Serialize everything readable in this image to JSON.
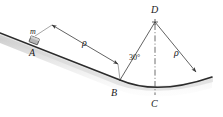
{
  "figure": {
    "colors": {
      "line": "#3a3a3a",
      "surface": "#2b2b2b",
      "shadow": "#c9c9c9",
      "block_fill": "#b5b5b5",
      "block_stroke": "#4a4a4a",
      "label": "#1a1a1a",
      "background": "#ffffff"
    },
    "labels": {
      "point_a": "A",
      "point_b": "B",
      "point_c": "C",
      "point_d": "D",
      "mass": "m",
      "radius_left": "ρ",
      "radius_right": "ρ",
      "angle": "30°"
    },
    "geometry": {
      "incline_start": [
        0,
        33
      ],
      "incline_end_at_b": [
        120,
        80
      ],
      "block_center": [
        34,
        41
      ],
      "center_of_curvature_d": [
        155,
        22
      ],
      "arc_bottom_c": [
        155,
        91
      ],
      "arc_end_right": [
        212,
        77
      ],
      "angle_value_degrees": 30,
      "radius_label_positions": {
        "left_dimension_arrow_from": [
          52,
          25
        ],
        "left_dimension_arrow_to": [
          118,
          64
        ],
        "right_radius_from": [
          155,
          22
        ],
        "right_radius_to": [
          196,
          72
        ]
      }
    }
  }
}
